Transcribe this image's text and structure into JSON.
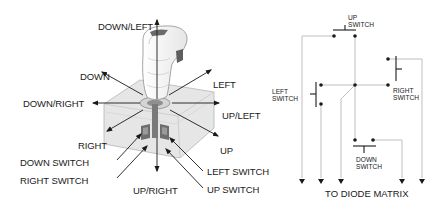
{
  "joystick_figure": {
    "direction_labels": {
      "down_left": "DOWN/LEFT",
      "down": "DOWN",
      "left": "LEFT",
      "down_right": "DOWN/RIGHT",
      "up_left": "UP/LEFT",
      "right": "RIGHT",
      "up": "UP",
      "up_right": "UP/RIGHT"
    },
    "switch_labels": {
      "down_switch": "DOWN SWITCH",
      "right_switch": "RIGHT SWITCH",
      "left_switch": "LEFT SWITCH",
      "up_switch": "UP SWITCH"
    }
  },
  "circuit_diagram": {
    "switches": {
      "up": [
        "UP",
        "SWITCH"
      ],
      "left": [
        "LEFT",
        "SWITCH"
      ],
      "right": [
        "RIGHT",
        "SWITCH"
      ],
      "down": [
        "DOWN",
        "SWITCH"
      ]
    },
    "output_label": "TO DIODE MATRIX",
    "output_count": 5
  },
  "colors": {
    "line": "#1a1a1a",
    "wire": "#b8b8b8",
    "base_fill": "#e4e4e4",
    "handle_fill": "#f2f2f2",
    "dark_part": "#6a6a6a"
  }
}
